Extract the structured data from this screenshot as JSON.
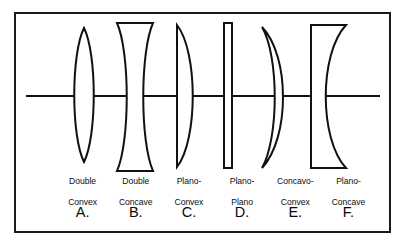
{
  "figure": {
    "frame": {
      "border_color": "#1a1a1a",
      "background_color": "#ffffff"
    },
    "optical_axis": {
      "name": "optical-axis",
      "color": "#111111",
      "y": 96,
      "x_start": 26,
      "x_end": 380
    },
    "stroke_color": "#111111",
    "fill_color": "#ffffff"
  },
  "lenses": [
    {
      "letter": "A.",
      "name_line1": "Double",
      "name_line2": "Convex",
      "name_full": "Double Convex",
      "shape": "biconvex",
      "center_x": 84
    },
    {
      "letter": "B.",
      "name_line1": "Double",
      "name_line2": "Concave",
      "name_full": "Double Concave",
      "shape": "biconcave",
      "center_x": 135
    },
    {
      "letter": "C.",
      "name_line1": "Plano-",
      "name_line2": "Convex",
      "name_full": "Plano-Convex",
      "shape": "plano-convex",
      "center_x": 186
    },
    {
      "letter": "D.",
      "name_line1": "Plano-",
      "name_line2": "Plano",
      "name_full": "Plano-Plano",
      "shape": "plano-plano",
      "center_x": 228
    },
    {
      "letter": "E.",
      "name_line1": "Concavo-",
      "name_line2": "Convex",
      "name_full": "Concavo-Convex",
      "shape": "meniscus",
      "center_x": 277
    },
    {
      "letter": "F.",
      "name_line1": "Plano-",
      "name_line2": "Concave",
      "name_full": "Plano-Concave",
      "shape": "plano-concave",
      "center_x": 329
    }
  ]
}
